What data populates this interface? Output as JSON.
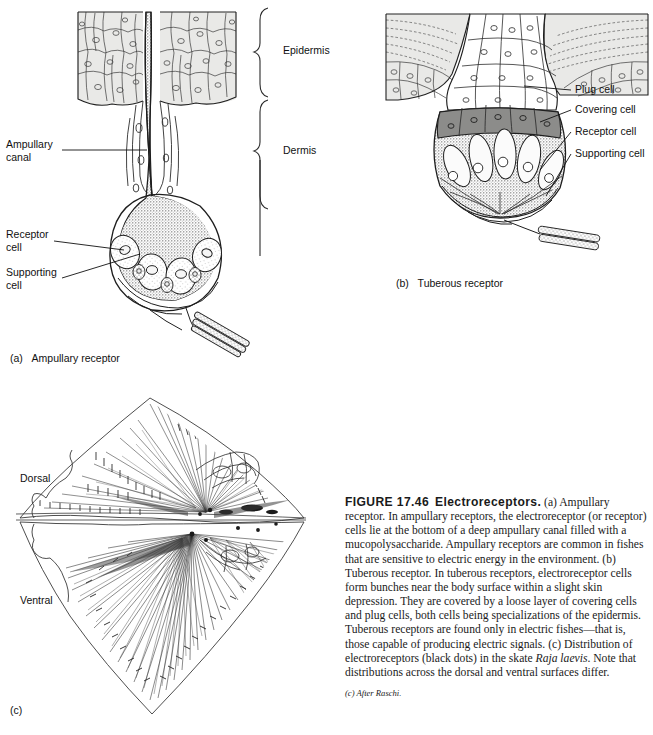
{
  "figure": {
    "number_label": "FIGURE 17.46",
    "title": "Electroreceptors.",
    "caption_paragraph": "(a) Ampullary receptor. In ampullary receptors, the electroreceptor (or receptor) cells lie at the bottom of a deep ampullary canal filled with a mucopolysaccharide. Ampullary receptors are common in fishes that are sensitive to electric energy in the environment. (b) Tuberous receptor. In tuberous receptors, electroreceptor cells form bunches near the body surface within a slight skin depression. They are covered by a loose layer of covering cells and plug cells, both cells being specializations of the epidermis. Tuberous receptors are found only in electric fishes—that is, those capable of producing electric signals. (c) Distribution of electroreceptors (black dots) in the skate ",
    "species_italic": "Raja laevis",
    "caption_tail": ". Note that distributions across the dorsal and ventral surfaces differ.",
    "credit": "(c) After Raschi."
  },
  "panel_a": {
    "key": "(a)",
    "caption": "Ampullary receptor",
    "labels": [
      {
        "name": "ampullary-canal",
        "line1": "Ampullary",
        "line2": "canal"
      },
      {
        "name": "receptor-cell",
        "line1": "Receptor",
        "line2": "cell"
      },
      {
        "name": "supporting-cell",
        "line1": "Supporting",
        "line2": "cell"
      }
    ],
    "brace_labels": [
      {
        "name": "epidermis",
        "text": "Epidermis"
      },
      {
        "name": "dermis",
        "text": "Dermis"
      }
    ]
  },
  "panel_b": {
    "key": "(b)",
    "caption": "Tuberous receptor",
    "labels": [
      {
        "name": "plug-cell",
        "text": "Plug cell"
      },
      {
        "name": "covering-cell",
        "text": "Covering cell"
      },
      {
        "name": "receptor-cell",
        "text": "Receptor cell"
      },
      {
        "name": "supporting-cell",
        "text": "Supporting cell"
      }
    ]
  },
  "panel_c": {
    "key": "(c)",
    "labels": [
      {
        "name": "dorsal",
        "text": "Dorsal"
      },
      {
        "name": "ventral",
        "text": "Ventral"
      }
    ]
  },
  "colors": {
    "page_background": "#ffffff",
    "ink": "#1a1a1a",
    "epidermis_fill": "#e9e9e7",
    "covering_cell_fill": "#8c8c8a",
    "stipple": "#555555",
    "text": "#111111"
  }
}
